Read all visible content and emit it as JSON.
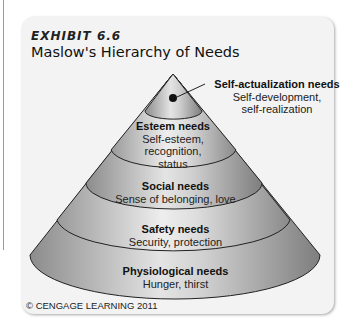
{
  "header": {
    "exhibit_label": "EXHIBIT 6.6",
    "title": "Maslow's Hierarchy of Needs"
  },
  "levels": [
    {
      "name": "Self-actualization needs",
      "line1": "Self-development,",
      "line2": "self-realization",
      "line3": ""
    },
    {
      "name": "Esteem needs",
      "line1": "Self-esteem,",
      "line2": "recognition,",
      "line3": "status"
    },
    {
      "name": "Social needs",
      "line1": "Sense of belonging, love",
      "line2": "",
      "line3": ""
    },
    {
      "name": "Safety needs",
      "line1": "Security, protection",
      "line2": "",
      "line3": ""
    },
    {
      "name": "Physiological needs",
      "line1": "Hunger, thirst",
      "line2": "",
      "line3": ""
    }
  ],
  "footer": {
    "copyright": "© CENGAGE LEARNING 2011"
  },
  "colors": {
    "card_bg": "#f3f3f3",
    "cone_light": "#d8d8d8",
    "cone_dark": "#8a8a8a",
    "outline": "#222222"
  }
}
